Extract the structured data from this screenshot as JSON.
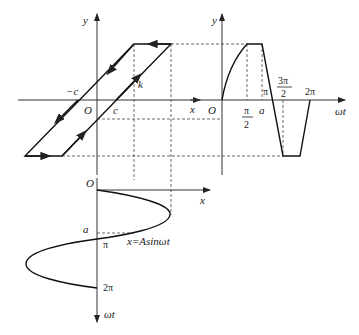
{
  "diagram": {
    "type": "backlash-nonlinearity-waveform-construction",
    "left_plot": {
      "x_axis_label": "x",
      "y_axis_label": "y",
      "origin_label": "O",
      "neg_c_label": "−c",
      "c_label": "c",
      "slope_label": "k"
    },
    "right_plot": {
      "y_axis_label": "y",
      "x_axis_label": "ωt",
      "origin_label": "O",
      "tick_pi_over_2_num": "π",
      "tick_pi_over_2_den": "2",
      "tick_a": "a",
      "tick_pi": "π",
      "tick_3pi_over_2_num": "3π",
      "tick_3pi_over_2_den": "2",
      "tick_2pi": "2π"
    },
    "bottom_plot": {
      "origin_label": "O",
      "x_axis_label": "x",
      "y_axis_label": "ωt",
      "a_label": "a",
      "pi_label": "π",
      "two_pi_label": "2π",
      "curve_label": "x=Asinωt"
    },
    "colors": {
      "line": "#111111",
      "axis": "#333333",
      "background": "#ffffff"
    }
  }
}
